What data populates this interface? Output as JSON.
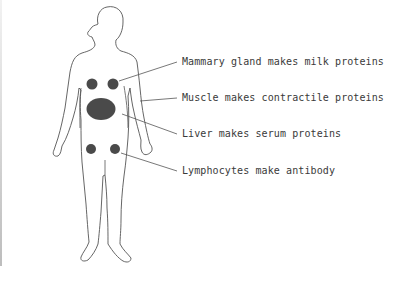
{
  "diagram": {
    "type": "anatomical-figure",
    "organ_color": "#4a4a4a",
    "outline_color": "#555555",
    "labels": [
      {
        "id": "mammary",
        "text": "Mammary gland makes milk proteins"
      },
      {
        "id": "muscle",
        "text": "Muscle makes contractile proteins"
      },
      {
        "id": "liver",
        "text": "Liver makes serum proteins"
      },
      {
        "id": "lymphocytes",
        "text": "Lymphocytes make antibody"
      }
    ]
  }
}
